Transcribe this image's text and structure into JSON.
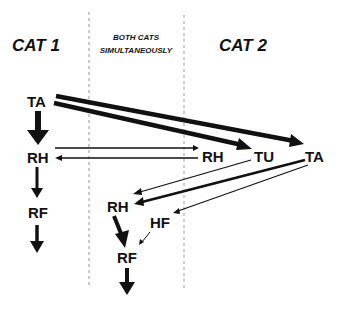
{
  "columns": {
    "left": "CAT 1",
    "middle_line1": "BOTH CATS",
    "middle_line2": "SIMULTANEOUSLY",
    "right": "CAT 2"
  },
  "nodes": {
    "cat1_ta": "TA",
    "cat1_rh": "RH",
    "cat1_rf": "RF",
    "cat2_rh": "RH",
    "cat2_tu": "TU",
    "cat2_ta": "TA",
    "both_rh": "RH",
    "both_hf": "HF",
    "both_rf": "RF"
  },
  "edges": [
    {
      "from": "cat1_ta",
      "to": "cat1_rh",
      "weight": "heavy"
    },
    {
      "from": "cat1_rh",
      "to": "cat1_rf",
      "weight": "medium"
    },
    {
      "from": "cat1_rf",
      "to": "out",
      "weight": "medium"
    },
    {
      "from": "cat1_ta",
      "to": "cat2_tu",
      "weight": "heavy"
    },
    {
      "from": "cat1_ta",
      "to": "cat2_ta",
      "weight": "heavy"
    },
    {
      "from": "cat1_rh",
      "to": "cat2_rh",
      "weight": "thin"
    },
    {
      "from": "cat2_rh",
      "to": "cat1_rh",
      "weight": "thin"
    },
    {
      "from": "cat2_tu",
      "to": "both_rh",
      "weight": "thin"
    },
    {
      "from": "cat2_ta",
      "to": "both_rh",
      "weight": "medium"
    },
    {
      "from": "cat2_ta",
      "to": "both_hf",
      "weight": "thin"
    },
    {
      "from": "both_hf",
      "to": "both_rf",
      "weight": "thin"
    },
    {
      "from": "both_rh",
      "to": "both_rf",
      "weight": "heavy"
    },
    {
      "from": "both_rf",
      "to": "out",
      "weight": "heavy"
    }
  ],
  "colors": {
    "ink": "#111111",
    "divider": "#999999",
    "background": "#ffffff"
  }
}
